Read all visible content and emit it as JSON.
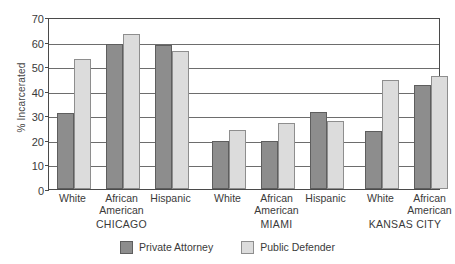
{
  "chart_data": {
    "type": "bar",
    "title": "",
    "xlabel": "",
    "ylabel": "% Incarcerated",
    "ylim": [
      0,
      70
    ],
    "ytick_step": 10,
    "yticks": [
      "0",
      "10",
      "20",
      "30",
      "40",
      "50",
      "60",
      "70"
    ],
    "grid": "horizontal",
    "legend_position": "bottom-center",
    "categories": [
      "White",
      "African American",
      "Hispanic",
      "White",
      "African American",
      "Hispanic",
      "White",
      "African American"
    ],
    "category_lines": [
      [
        "White"
      ],
      [
        "African",
        "American"
      ],
      [
        "Hispanic"
      ],
      [
        "White"
      ],
      [
        "African",
        "American"
      ],
      [
        "Hispanic"
      ],
      [
        "White"
      ],
      [
        "African",
        "American"
      ]
    ],
    "groups": [
      {
        "label": "CHICAGO",
        "categories": [
          "White",
          "African American",
          "Hispanic"
        ]
      },
      {
        "label": "MIAMI",
        "categories": [
          "White",
          "African American",
          "Hispanic"
        ]
      },
      {
        "label": "KANSAS CITY",
        "categories": [
          "White",
          "African American"
        ]
      }
    ],
    "series": [
      {
        "name": "Private Attorney",
        "color": "#8d8d8d",
        "values": [
          31,
          59,
          58.5,
          19.5,
          19.5,
          31.5,
          23.5,
          42.5
        ]
      },
      {
        "name": "Public Defender",
        "color": "#dcdcdc",
        "values": [
          53,
          63,
          56,
          24,
          27,
          27.5,
          44.5,
          46
        ]
      }
    ]
  },
  "legend": {
    "items": [
      {
        "label": "Private Attorney",
        "key": "private"
      },
      {
        "label": "Public Defender",
        "key": "public"
      }
    ]
  }
}
